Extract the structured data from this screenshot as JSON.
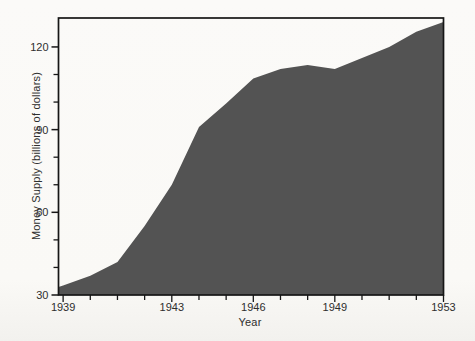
{
  "figure": {
    "background": "#fbfaf8"
  },
  "chart_data": {
    "type": "area",
    "title": "",
    "xlabel": "Year",
    "ylabel": "Money Supply (billions of dollars)",
    "x": [
      1939,
      1940,
      1941,
      1942,
      1943,
      1944,
      1945,
      1946,
      1947,
      1948,
      1949,
      1950,
      1951,
      1952,
      1953
    ],
    "values": [
      33.5,
      37,
      42,
      55,
      70,
      91,
      99.5,
      108.5,
      112,
      113.5,
      112,
      116,
      120,
      125.5,
      129
    ],
    "series_name": "Money supply",
    "xlim": [
      1938.83,
      1953
    ],
    "ylim": [
      30,
      130.5
    ],
    "y_major_ticks": [
      30,
      60,
      90,
      120
    ],
    "y_minor_ticks": [
      40,
      50,
      70,
      80,
      100,
      110
    ],
    "x_ticks_every_year": true,
    "x_labeled_ticks": [
      1939,
      1943,
      1946,
      1949,
      1953
    ],
    "grid": false,
    "legend": null,
    "fill_color": "#535353",
    "axis_color": "#161616",
    "tick_label_color": "#2e2e2e",
    "tick_label_font_px": 11
  }
}
